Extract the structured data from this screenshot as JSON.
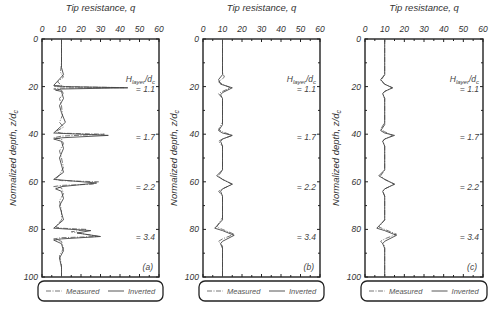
{
  "figure": {
    "panel_labels": [
      "(a)",
      "(b)",
      "(c)"
    ]
  },
  "chart_data": [
    {
      "type": "line",
      "panel": "(a)",
      "title": "Tip resistance, q",
      "xlabel": "Tip resistance, q",
      "ylabel": "Normalized depth, z/d_c",
      "xlim": [
        0,
        60
      ],
      "ylim": [
        100,
        0
      ],
      "xticks": [
        0,
        10,
        20,
        30,
        40,
        50,
        60
      ],
      "yticks": [
        0,
        20,
        40,
        60,
        80,
        100
      ],
      "x_axis_position": "top",
      "grid": false,
      "legend": {
        "position": "bottom",
        "entries": [
          "Measured",
          "Inverted"
        ]
      },
      "annotations": [
        {
          "text": "H_layer/d_c",
          "depth": 17
        },
        {
          "text": "= 1.1",
          "depth": 21
        },
        {
          "text": "= 1.7",
          "depth": 41
        },
        {
          "text": "= 2.2",
          "depth": 62
        },
        {
          "text": "= 3.4",
          "depth": 83
        }
      ],
      "series": [
        {
          "name": "Measured",
          "style": "dash-dot",
          "points": [
            [
              10,
              0
            ],
            [
              10,
              10
            ],
            [
              9.5,
              14
            ],
            [
              11,
              16
            ],
            [
              8,
              18
            ],
            [
              10,
              19.5
            ],
            [
              6,
              20
            ],
            [
              42,
              20.4
            ],
            [
              10,
              20.6
            ],
            [
              6,
              21
            ],
            [
              10,
              21.5
            ],
            [
              11,
              23
            ],
            [
              9,
              25
            ],
            [
              10,
              28
            ],
            [
              10.5,
              32
            ],
            [
              9,
              35
            ],
            [
              11,
              37
            ],
            [
              7,
              39
            ],
            [
              10,
              39.6
            ],
            [
              32,
              40
            ],
            [
              10,
              40.8
            ],
            [
              6,
              41.5
            ],
            [
              10,
              42
            ],
            [
              11,
              44
            ],
            [
              9,
              47
            ],
            [
              10,
              50
            ],
            [
              11,
              54
            ],
            [
              9,
              57
            ],
            [
              7,
              59
            ],
            [
              10,
              59.5
            ],
            [
              29,
              60
            ],
            [
              26,
              61
            ],
            [
              10,
              61.5
            ],
            [
              6,
              62
            ],
            [
              10,
              62.5
            ],
            [
              11,
              65
            ],
            [
              9,
              68
            ],
            [
              10,
              72
            ],
            [
              10,
              76
            ],
            [
              7,
              79
            ],
            [
              10,
              79.5
            ],
            [
              23,
              80
            ],
            [
              15,
              81
            ],
            [
              29,
              83
            ],
            [
              10,
              83.5
            ],
            [
              6,
              84
            ],
            [
              10,
              85
            ],
            [
              11,
              88
            ],
            [
              9,
              91
            ],
            [
              10,
              95
            ],
            [
              10,
              100
            ]
          ]
        },
        {
          "name": "Inverted",
          "style": "solid",
          "points": [
            [
              10,
              0
            ],
            [
              10,
              12
            ],
            [
              11,
              15
            ],
            [
              6,
              19.5
            ],
            [
              12,
              20
            ],
            [
              44,
              20.5
            ],
            [
              10,
              21
            ],
            [
              7,
              21.5
            ],
            [
              10,
              22
            ],
            [
              11,
              25
            ],
            [
              9,
              28
            ],
            [
              10,
              31
            ],
            [
              12,
              35
            ],
            [
              6,
              39.5
            ],
            [
              34,
              40.5
            ],
            [
              10,
              41.5
            ],
            [
              6,
              42
            ],
            [
              10,
              43
            ],
            [
              11,
              46
            ],
            [
              9,
              50
            ],
            [
              10,
              53
            ],
            [
              11,
              56
            ],
            [
              6,
              59
            ],
            [
              28,
              60.5
            ],
            [
              10,
              62
            ],
            [
              7,
              63
            ],
            [
              10,
              64
            ],
            [
              11,
              67
            ],
            [
              9,
              70
            ],
            [
              10,
              73
            ],
            [
              11,
              76
            ],
            [
              6,
              79.5
            ],
            [
              25,
              80.5
            ],
            [
              18,
              81.5
            ],
            [
              30,
              83
            ],
            [
              10,
              84
            ],
            [
              6,
              84.5
            ],
            [
              10,
              86
            ],
            [
              11,
              89
            ],
            [
              9,
              92
            ],
            [
              10,
              96
            ],
            [
              10,
              100
            ]
          ]
        }
      ]
    },
    {
      "type": "line",
      "panel": "(b)",
      "title": "Tip resistance, q",
      "xlabel": "Tip resistance, q",
      "ylabel": "Normalized depth, z/d_c",
      "xlim": [
        0,
        60
      ],
      "ylim": [
        100,
        0
      ],
      "xticks": [
        0,
        10,
        20,
        30,
        40,
        50,
        60
      ],
      "yticks": [
        0,
        20,
        40,
        60,
        80,
        100
      ],
      "x_axis_position": "top",
      "grid": false,
      "legend": {
        "position": "bottom",
        "entries": [
          "Measured",
          "Inverted"
        ]
      },
      "annotations": [
        {
          "text": "H_layer/d_c",
          "depth": 17
        },
        {
          "text": "= 1.1",
          "depth": 21
        },
        {
          "text": "= 1.7",
          "depth": 41
        },
        {
          "text": "= 2.2",
          "depth": 62
        },
        {
          "text": "= 3.4",
          "depth": 83
        }
      ],
      "series": [
        {
          "name": "Measured",
          "style": "dash-dot",
          "points": [
            [
              10,
              0
            ],
            [
              10,
              14
            ],
            [
              11,
              16
            ],
            [
              8,
              18
            ],
            [
              10,
              19
            ],
            [
              14,
              20.5
            ],
            [
              10,
              22
            ],
            [
              8,
              23
            ],
            [
              10,
              25
            ],
            [
              10,
              35
            ],
            [
              8,
              38
            ],
            [
              10,
              39
            ],
            [
              15,
              40.5
            ],
            [
              10,
              42
            ],
            [
              8,
              43
            ],
            [
              10,
              45
            ],
            [
              10,
              55
            ],
            [
              8,
              57.5
            ],
            [
              10,
              59
            ],
            [
              15,
              61
            ],
            [
              10,
              63
            ],
            [
              8,
              64
            ],
            [
              10,
              66
            ],
            [
              10,
              75
            ],
            [
              7,
              79
            ],
            [
              10,
              80
            ],
            [
              16,
              82
            ],
            [
              10,
              84
            ],
            [
              8,
              85
            ],
            [
              10,
              87
            ],
            [
              10,
              100
            ]
          ]
        },
        {
          "name": "Inverted",
          "style": "solid",
          "points": [
            [
              10,
              0
            ],
            [
              10,
              15
            ],
            [
              8,
              17
            ],
            [
              9,
              19
            ],
            [
              15,
              20.5
            ],
            [
              10,
              22.5
            ],
            [
              9,
              23.5
            ],
            [
              10,
              25
            ],
            [
              10,
              36
            ],
            [
              8,
              38.5
            ],
            [
              10,
              39.5
            ],
            [
              15,
              40.5
            ],
            [
              10,
              42
            ],
            [
              9,
              43
            ],
            [
              10,
              45
            ],
            [
              10,
              55
            ],
            [
              7,
              57.5
            ],
            [
              10,
              59
            ],
            [
              15,
              61
            ],
            [
              10,
              63
            ],
            [
              9,
              64
            ],
            [
              10,
              66
            ],
            [
              10,
              76
            ],
            [
              6,
              79.5
            ],
            [
              10,
              80.5
            ],
            [
              16,
              82.5
            ],
            [
              10,
              85
            ],
            [
              9,
              86
            ],
            [
              10,
              88
            ],
            [
              10,
              100
            ]
          ]
        }
      ]
    },
    {
      "type": "line",
      "panel": "(c)",
      "title": "Tip resistance, q",
      "xlabel": "Tip resistance, q",
      "ylabel": "Normalized depth, z/d_c",
      "xlim": [
        0,
        60
      ],
      "ylim": [
        100,
        0
      ],
      "xticks": [
        0,
        10,
        20,
        30,
        40,
        50,
        60
      ],
      "yticks": [
        0,
        20,
        40,
        60,
        80,
        100
      ],
      "x_axis_position": "top",
      "grid": false,
      "legend": {
        "position": "bottom",
        "entries": [
          "Measured",
          "Inverted"
        ]
      },
      "annotations": [
        {
          "text": "H_layer/d_c",
          "depth": 17
        },
        {
          "text": "= 1.1",
          "depth": 21
        },
        {
          "text": "= 1.7",
          "depth": 41
        },
        {
          "text": "= 2.2",
          "depth": 62
        },
        {
          "text": "= 3.4",
          "depth": 83
        }
      ],
      "series": [
        {
          "name": "Measured",
          "style": "dash-dot",
          "points": [
            [
              10,
              0
            ],
            [
              10,
              15
            ],
            [
              8,
              17.5
            ],
            [
              10,
              19
            ],
            [
              14,
              20.5
            ],
            [
              10,
              22
            ],
            [
              9,
              23
            ],
            [
              10,
              25
            ],
            [
              10,
              35
            ],
            [
              8,
              38
            ],
            [
              10,
              39
            ],
            [
              14,
              40.5
            ],
            [
              10,
              42
            ],
            [
              9,
              43
            ],
            [
              10,
              45
            ],
            [
              10,
              55
            ],
            [
              8,
              57.5
            ],
            [
              10,
              59
            ],
            [
              15,
              61
            ],
            [
              10,
              63
            ],
            [
              9,
              64
            ],
            [
              10,
              66
            ],
            [
              10,
              76
            ],
            [
              7,
              79
            ],
            [
              10,
              80
            ],
            [
              16,
              82
            ],
            [
              10,
              84
            ],
            [
              8,
              85
            ],
            [
              10,
              87
            ],
            [
              10,
              100
            ]
          ]
        },
        {
          "name": "Inverted",
          "style": "solid",
          "points": [
            [
              10,
              0
            ],
            [
              10,
              15
            ],
            [
              8,
              17
            ],
            [
              10,
              19
            ],
            [
              14,
              20.5
            ],
            [
              10,
              22
            ],
            [
              9,
              23
            ],
            [
              10,
              25
            ],
            [
              10,
              36
            ],
            [
              8,
              38.5
            ],
            [
              10,
              39.5
            ],
            [
              15,
              40.5
            ],
            [
              10,
              42
            ],
            [
              9,
              43
            ],
            [
              10,
              45
            ],
            [
              10,
              55
            ],
            [
              7,
              57.5
            ],
            [
              10,
              59
            ],
            [
              15,
              61
            ],
            [
              10,
              63
            ],
            [
              9,
              64
            ],
            [
              10,
              66
            ],
            [
              10,
              76
            ],
            [
              6,
              79.5
            ],
            [
              10,
              80.5
            ],
            [
              16,
              82.5
            ],
            [
              10,
              85
            ],
            [
              9,
              86
            ],
            [
              10,
              88
            ],
            [
              10,
              100
            ]
          ]
        }
      ]
    }
  ]
}
